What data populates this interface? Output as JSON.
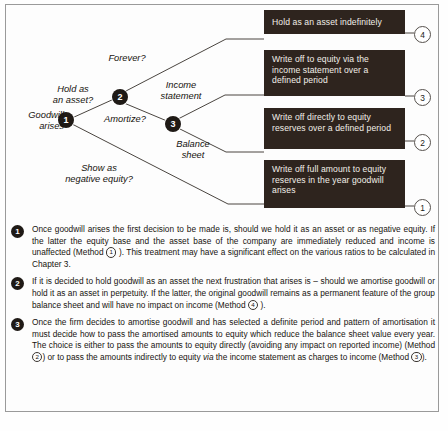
{
  "figure": {
    "nodes": [
      {
        "id": "1",
        "label": "1"
      },
      {
        "id": "2",
        "label": "2"
      },
      {
        "id": "3",
        "label": "3"
      }
    ],
    "branch_labels": {
      "goodwill_arises": "Goodwill\narises",
      "hold_as_an_asset": "Hold as\nan asset?",
      "forever": "Forever?",
      "amortize": "Amortize?",
      "income_statement": "Income\nstatement",
      "balance_sheet": "Balance\nsheet",
      "show_as_negative_equity": "Show as\nnegative equity?"
    },
    "outcomes": [
      {
        "number": "4",
        "text": "Hold as an asset indefinitely"
      },
      {
        "number": "3",
        "text": "Write off to equity via the income statement over a defined period"
      },
      {
        "number": "2",
        "text": "Write off directly to equity reserves over a defined period"
      },
      {
        "number": "1",
        "text": "Write off full amount to equity reserves in the year goodwill arises"
      }
    ],
    "colors": {
      "box_fill": "#2e241e",
      "box_text": "#f2efe9",
      "node_fill": "#1f1a16",
      "frame_border": "#9a9a9a"
    }
  },
  "notes": [
    {
      "number": "1",
      "parts": [
        {
          "t": "text",
          "v": "Once goodwill arises the first decision to be made is, should we hold it as an asset or as negative equity. If the latter the equity base and the asset base of the company are immediately reduced and income is unaffected (Method "
        },
        {
          "t": "circle",
          "v": "1"
        },
        {
          "t": "text",
          "v": " ). This treatment may have a significant effect on the various ratios to be calculated in Chapter 3."
        }
      ]
    },
    {
      "number": "2",
      "parts": [
        {
          "t": "text",
          "v": "If it is decided to hold goodwill as an asset the next frustration that arises is – should we amortise goodwill or hold it as an asset in perpetuity. If the latter, the original goodwill remains as a permanent feature of the group balance sheet and will have no impact on income (Method "
        },
        {
          "t": "circle",
          "v": "4"
        },
        {
          "t": "text",
          "v": " )."
        }
      ]
    },
    {
      "number": "3",
      "parts": [
        {
          "t": "text",
          "v": "Once the firm decides to amortise goodwill and has selected a definite period and pattern of amortisation it must decide how to pass the amortised amounts to equity which reduce the balance sheet value every year. The choice is either to pass the amounts to equity directly (avoiding any impact on reported income) (Method "
        },
        {
          "t": "circle",
          "v": "2"
        },
        {
          "t": "text",
          "v": ") or to pass the amounts indirectly to equity "
        },
        {
          "t": "italic",
          "v": "via"
        },
        {
          "t": "text",
          "v": " the income statement as charges to income (Method "
        },
        {
          "t": "circle",
          "v": "3"
        },
        {
          "t": "text",
          "v": ")."
        }
      ]
    }
  ]
}
